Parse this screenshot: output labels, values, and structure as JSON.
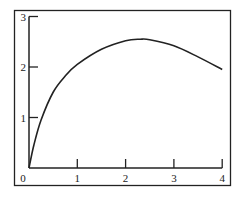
{
  "chart_data": {
    "type": "line",
    "title": "",
    "xlabel": "",
    "ylabel": "",
    "xlim": [
      0,
      4
    ],
    "ylim": [
      0,
      3
    ],
    "grid": false,
    "x_ticks": [
      "0",
      "1",
      "2",
      "3",
      "4"
    ],
    "y_ticks": [
      "1",
      "2",
      "3"
    ],
    "series": [
      {
        "name": "curve",
        "x": [
          0,
          0.1,
          0.25,
          0.5,
          0.75,
          1.0,
          1.5,
          2.0,
          2.3,
          2.5,
          3.0,
          3.5,
          4.0
        ],
        "values": [
          0,
          0.45,
          0.95,
          1.5,
          1.82,
          2.05,
          2.35,
          2.52,
          2.55,
          2.54,
          2.42,
          2.2,
          1.95
        ]
      }
    ]
  }
}
